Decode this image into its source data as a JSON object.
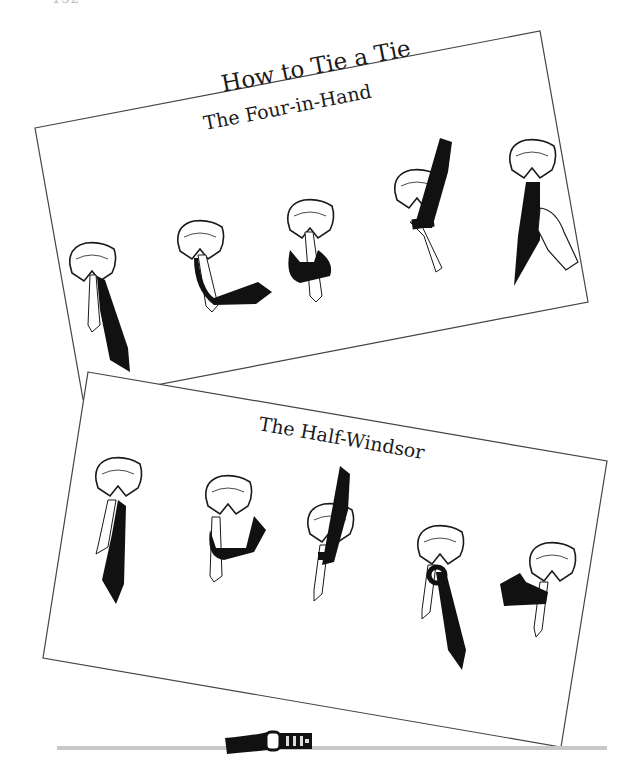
{
  "page": {
    "page_number_partial": "132",
    "main_title": "How to Tie a Tie",
    "sections": [
      {
        "title": "The Four-in-Hand",
        "steps": [
          {
            "step": 1,
            "illustration": "collar-with-untied-tie"
          },
          {
            "step": 2,
            "illustration": "wide-end-crossed-over"
          },
          {
            "step": 3,
            "illustration": "wide-end-wrapped-around"
          },
          {
            "step": 4,
            "illustration": "wide-end-up-through-neck-loop"
          },
          {
            "step": 5,
            "illustration": "hand-tightening-knot"
          }
        ]
      },
      {
        "title": "The Half-Windsor",
        "steps": [
          {
            "step": 1,
            "illustration": "collar-with-untied-tie"
          },
          {
            "step": 2,
            "illustration": "wide-end-wrapped-behind"
          },
          {
            "step": 3,
            "illustration": "wide-end-up-through-loop"
          },
          {
            "step": 4,
            "illustration": "wide-end-down-through-knot"
          },
          {
            "step": 5,
            "illustration": "wide-end-across-front"
          }
        ]
      }
    ],
    "footer_ornament": "belt-buckle-divider",
    "colors": {
      "ink": "#1a1a1a",
      "paper": "#ffffff",
      "divider": "#c8c8c8"
    }
  }
}
